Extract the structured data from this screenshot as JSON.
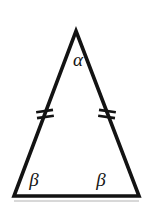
{
  "figure": {
    "kind": "geometry-diagram",
    "shape_name": "isosceles triangle",
    "background_color": "#ffffff",
    "stroke_color": "#131313",
    "label_color": "#141414",
    "canvas": {
      "width": 145,
      "height": 208
    },
    "vertices": {
      "apex": {
        "x": 76,
        "y": 31
      },
      "base_left": {
        "x": 14,
        "y": 196
      },
      "base_right": {
        "x": 139,
        "y": 196
      }
    },
    "outline_stroke_width": 3.6,
    "angle_labels": [
      {
        "id": "apex-angle",
        "text": "α",
        "x": 78,
        "y": 66,
        "font_size": 19
      },
      {
        "id": "base-left-angle",
        "text": "β",
        "x": 34,
        "y": 186,
        "font_size": 19
      },
      {
        "id": "base-right-angle",
        "text": "β",
        "x": 101,
        "y": 186,
        "font_size": 19
      }
    ],
    "congruence_ticks": [
      {
        "id": "left-leg-ticks",
        "side": "left-leg",
        "count": 2,
        "center": {
          "x": 45,
          "y": 114
        },
        "stroke_width": 2.6,
        "length": 17,
        "spacing": 6,
        "angle_deg": -8
      },
      {
        "id": "right-leg-ticks",
        "side": "right-leg",
        "count": 2,
        "center": {
          "x": 107,
          "y": 114
        },
        "stroke_width": 2.6,
        "length": 17,
        "spacing": 6,
        "angle_deg": 8
      }
    ],
    "baseline_shadow": {
      "color": "#d8d8d8",
      "x": 14,
      "y": 200,
      "width": 125,
      "height": 2
    }
  }
}
